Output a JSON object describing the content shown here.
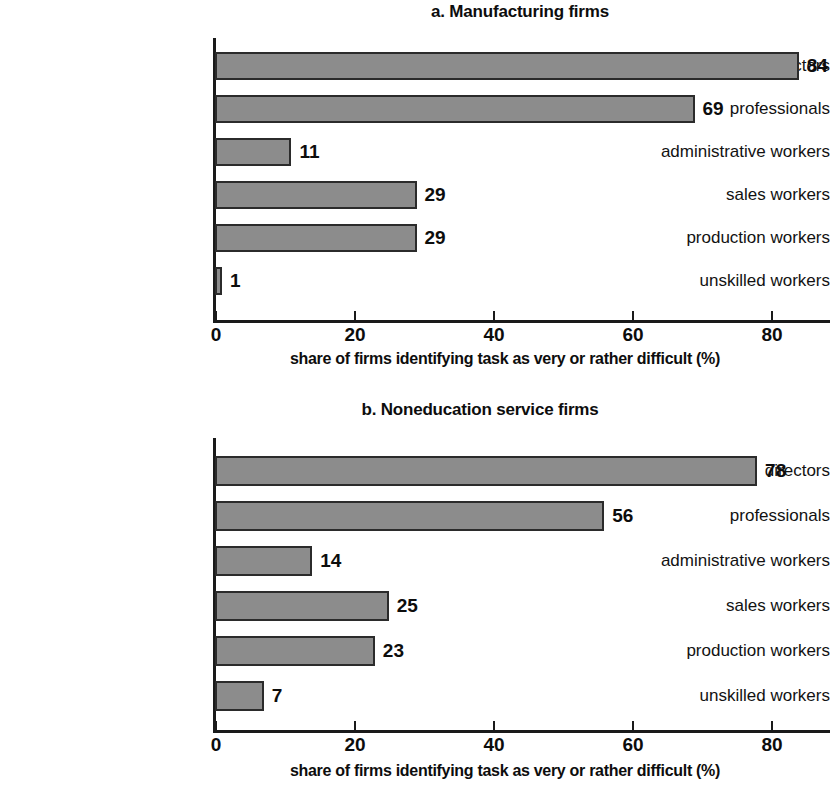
{
  "figure": {
    "background_color": "#ffffff",
    "bar_fill_color": "#8c8c8c",
    "bar_border_color": "#2b2b2b",
    "axis_color": "#1a1a1a"
  },
  "chart_data": [
    {
      "type": "bar",
      "orientation": "horizontal",
      "panel_id": "a",
      "title": "a. Manufacturing firms",
      "xlabel": "share of firms identifying task as very or rather difficult (%)",
      "ylabel": "",
      "categories": [
        "directors",
        "professionals",
        "administrative workers",
        "sales workers",
        "production workers",
        "unskilled workers"
      ],
      "values": [
        84,
        69,
        11,
        29,
        29,
        1
      ],
      "value_labels": [
        "84",
        "69",
        "11",
        "29",
        "29",
        "1"
      ],
      "xlim": [
        0,
        88
      ],
      "xticks": [
        0,
        20,
        40,
        60,
        80
      ],
      "xtick_labels": [
        "0",
        "20",
        "40",
        "60",
        "80"
      ],
      "grid": false,
      "legend": false
    },
    {
      "type": "bar",
      "orientation": "horizontal",
      "panel_id": "b",
      "title": "b. Noneducation service firms",
      "xlabel": "share of firms identifying task as very or rather difficult (%)",
      "ylabel": "",
      "categories": [
        "directors",
        "professionals",
        "administrative workers",
        "sales workers",
        "production workers",
        "unskilled workers"
      ],
      "values": [
        78,
        56,
        14,
        25,
        23,
        7
      ],
      "value_labels": [
        "78",
        "56",
        "14",
        "25",
        "23",
        "7"
      ],
      "xlim": [
        0,
        88
      ],
      "xticks": [
        0,
        20,
        40,
        60,
        80
      ],
      "xtick_labels": [
        "0",
        "20",
        "40",
        "60",
        "80"
      ],
      "grid": false,
      "legend": false
    }
  ]
}
